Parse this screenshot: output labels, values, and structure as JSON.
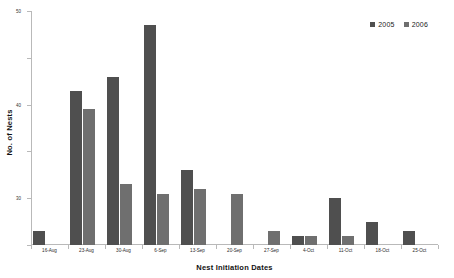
{
  "chart_data": {
    "type": "bar",
    "title": "",
    "xlabel": "Nest Initiation Dates",
    "ylabel": "No. of Nests",
    "categories": [
      "16-Aug",
      "23-Aug",
      "30-Aug",
      "6-Sep",
      "13-Sep",
      "20-Sep",
      "27-Sep",
      "4-Oct",
      "11-Oct",
      "18-Oct",
      "25-Oct"
    ],
    "series": [
      {
        "name": "2005",
        "color": "#4f4f4f",
        "values": [
          3,
          33,
          36,
          47,
          16,
          0,
          0,
          2,
          10,
          5,
          3
        ]
      },
      {
        "name": "2006",
        "color": "#6f6f6f",
        "values": [
          0,
          29,
          13,
          11,
          12,
          11,
          3,
          2,
          2,
          0,
          0
        ]
      }
    ],
    "ylim": [
      0,
      50
    ],
    "yticks": [
      0,
      10,
      20,
      30,
      40,
      50
    ],
    "grid": false,
    "legend_position": "top-right"
  },
  "legend": {
    "items": [
      {
        "label": "2005",
        "color": "#4f4f4f"
      },
      {
        "label": "2006",
        "color": "#6f6f6f"
      }
    ]
  },
  "axes": {
    "x_title": "Nest Initiation Dates",
    "y_title": "No. of Nests"
  }
}
